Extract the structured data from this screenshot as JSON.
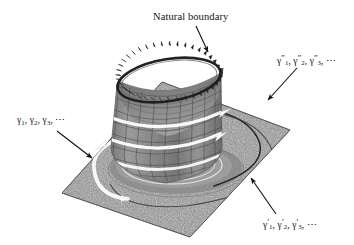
{
  "figure": {
    "kind": "3d-illustration",
    "background_color": "#ffffff",
    "plane_color": "#8e8e8e",
    "surface_color": "#8a8a8a",
    "boundary_color": "#2c2c2c",
    "arrow_color": "#ffffff",
    "curve_color": "#242424",
    "leader_color": "#111111"
  },
  "labels": {
    "natural_boundary": "Natural boundary",
    "gamma_plain": {
      "g1": "γ",
      "s1": "1",
      "sep1": ", ",
      "g2": "γ",
      "s2": "2",
      "sep2": ", ",
      "g3": "γ",
      "s3": "3",
      "sep3": ", ",
      "dots": "⋯"
    },
    "gamma_prime": {
      "g1": "γ",
      "p1": "′",
      "s1": "1",
      "sep1": ", ",
      "g2": "γ",
      "p2": "′",
      "s2": "2",
      "sep2": ", ",
      "g3": "γ",
      "p3": "′",
      "s3": "3",
      "sep3": ", ",
      "dots": "⋯"
    },
    "gamma_double_prime": {
      "g1": "γ",
      "p1": "″",
      "s1": "1",
      "sep1": ", ",
      "g2": "γ",
      "p2": "″",
      "s2": "2",
      "sep2": ", ",
      "g3": "γ",
      "p3": "″",
      "s3": "3",
      "sep3": ", ",
      "dots": "⋯"
    }
  },
  "annotations": {
    "leader_natural_boundary": "arrow from caption down-right to serrated rim",
    "leader_gamma_plain": "arrow from left caption down-right to base plane edge",
    "leader_gamma_prime": "arrow from lower-right caption up-left to outer plane arc",
    "leader_gamma_double_prime": "arrow from upper-right caption down-left to inner plane arc"
  }
}
